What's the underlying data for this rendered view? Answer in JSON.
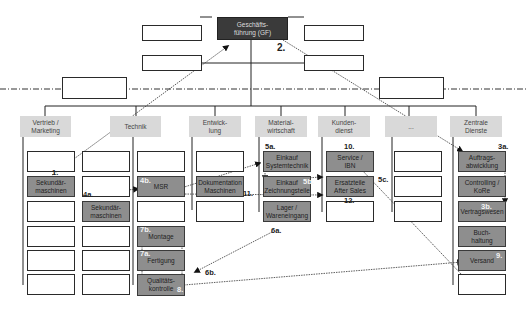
{
  "diagram": {
    "top": {
      "label": "Geschäfts-\nführung (GF)",
      "step": "2."
    },
    "staff_boxes": [
      "",
      "",
      "",
      "",
      "",
      ""
    ],
    "departments": [
      {
        "label": "Vertrieb /\nMarketing"
      },
      {
        "label": "Technik"
      },
      {
        "label": "Entwick-\nlung"
      },
      {
        "label": "Material-\nwirtschaft"
      },
      {
        "label": "Kunden-\ndienst"
      },
      {
        "label": "..."
      },
      {
        "label": "Zentrale\nDienste"
      }
    ],
    "units": {
      "vertrieb": [
        "",
        "Sekundär-\nmaschinen",
        "",
        "",
        "",
        ""
      ],
      "vertrieb2": [
        "",
        "",
        "Sekundär-\nmaschinen",
        "",
        "",
        ""
      ],
      "technik": [
        "",
        "MSR",
        "",
        "Montage",
        "Fertigung",
        "Qualitäts-\nkontrolle"
      ],
      "entwicklung": [
        "",
        "Dokumentation\nMaschinen",
        ""
      ],
      "materialwirtschaft": [
        "Einkauf\nSystemtechnik",
        "Einkauf\nZeichnungsteile",
        "Lager /\nWareneingang"
      ],
      "kundendienst": [
        "Service /\nIBN",
        "Ersatzteile\nAfter Sales",
        ""
      ],
      "other": [
        "",
        "",
        ""
      ],
      "zentrale": [
        "Auftrags-\nabwicklung",
        "Controlling /\nKoRe",
        "Vertragswesen",
        "Buch-\nhaltung",
        "Versand",
        ""
      ]
    },
    "steps": {
      "s1": "1.",
      "s2": "2.",
      "s3a": "3a.",
      "s3b": "3b.",
      "s4a": "4a.",
      "s4b": "4b.",
      "s5a": "5a.",
      "s5b": "5b.",
      "s5c": "5c.",
      "s6a": "6a.",
      "s6b": "6b.",
      "s7a": "7a.",
      "s7b": "7b.",
      "s8": "8.",
      "s9": "9.",
      "s10": "10.",
      "s11": "11.",
      "s12": "12."
    }
  }
}
